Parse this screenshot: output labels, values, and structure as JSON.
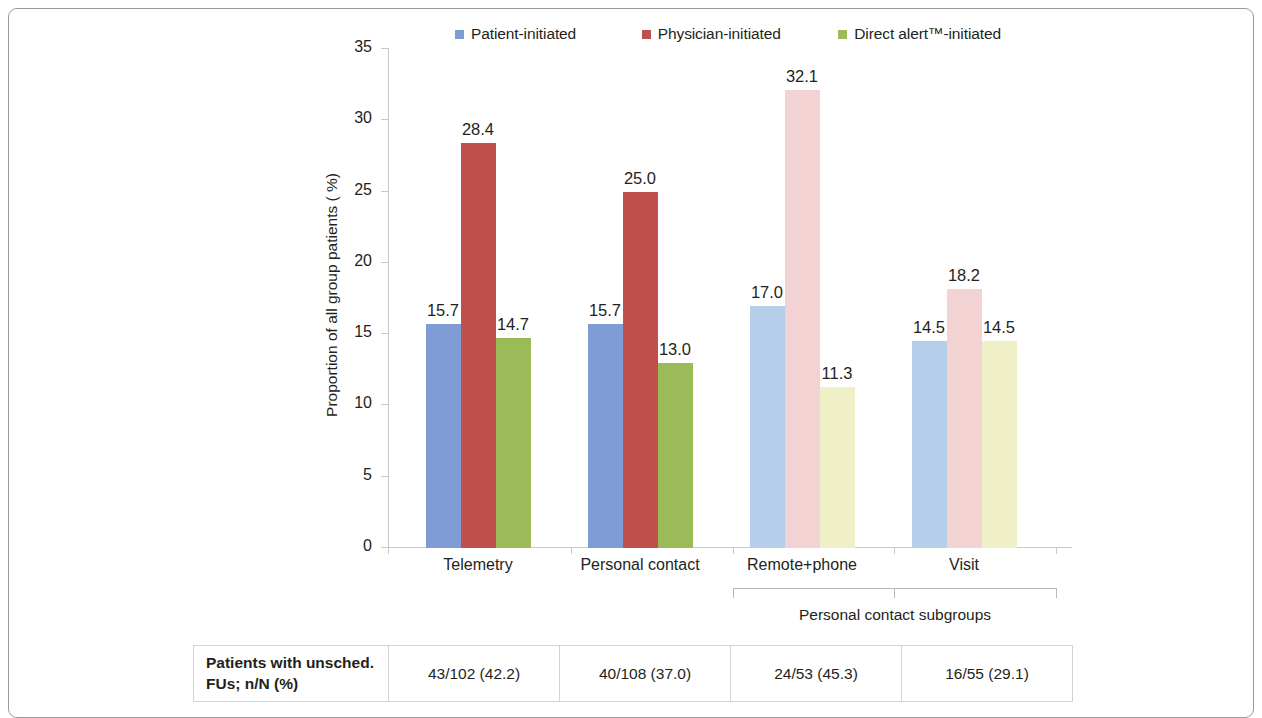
{
  "chart_data": {
    "type": "bar",
    "title": "",
    "xlabel": "",
    "ylabel": "Proportion of all group patients ( %)",
    "ylim": [
      0,
      35
    ],
    "ytick_labels": [
      "35",
      "30",
      "25",
      "20",
      "15",
      "10",
      "5",
      "0"
    ],
    "ytick_values": [
      35,
      30,
      25,
      20,
      15,
      10,
      5,
      0
    ],
    "grid": false,
    "legend_position": "top-center",
    "categories": [
      "Telemetry",
      "Personal contact",
      "Remote+phone",
      "Visit"
    ],
    "series": [
      {
        "name": "Patient-initiated",
        "color": "#7f9cd4",
        "muted_color": "#b5cfeb",
        "values": [
          15.7,
          15.7,
          17.0,
          14.5
        ],
        "labels": [
          "15.7",
          "15.7",
          "17.0",
          "14.5"
        ]
      },
      {
        "name": "Physician-initiated",
        "color": "#c0504d",
        "muted_color": "#f2d2d2",
        "values": [
          28.4,
          25.0,
          32.1,
          18.2
        ],
        "labels": [
          "28.4",
          "25.0",
          "32.1",
          "18.2"
        ]
      },
      {
        "name": "Direct alert™-initiated",
        "color": "#9bbb59",
        "muted_color": "#f0f0c8",
        "values": [
          14.7,
          13.0,
          11.3,
          14.5
        ],
        "labels": [
          "14.7",
          "13.0",
          "11.3",
          "14.5"
        ]
      }
    ],
    "muted_group_indices": [
      2,
      3
    ],
    "subgroup_bracket": {
      "label": "Personal contact subgroups",
      "spans_categories": [
        "Remote+phone",
        "Visit"
      ]
    },
    "table": {
      "row_header": "Patients with unsched. FUs; n/N (%)",
      "row_header_line1": "Patients with unsched.",
      "row_header_line2": "FUs; n/N (%)",
      "values": [
        "43/102 (42.2)",
        "40/108 (37.0)",
        "24/53 (45.3)",
        "16/55 (29.1)"
      ]
    }
  },
  "legend": {
    "items": [
      {
        "label": "Patient-initiated",
        "color": "#7f9cd4"
      },
      {
        "label": "Physician-initiated",
        "color": "#c0504d"
      },
      {
        "label": "Direct alert™-initiated",
        "color": "#9bbb59"
      }
    ]
  }
}
